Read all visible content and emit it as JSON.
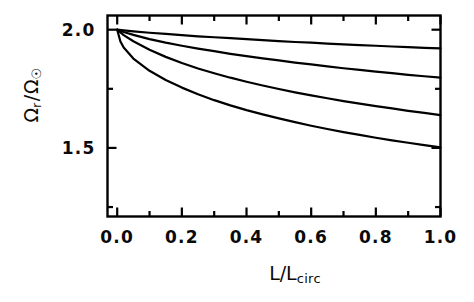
{
  "figure": {
    "background_color": "#ffffff",
    "line_color": "#000000",
    "text_color": "#0a0a0a"
  },
  "axis_titles": {
    "x_main": "L/L",
    "x_sub": "circ",
    "y_num": "Ω",
    "y_num_sub": "r",
    "y_slash": "/",
    "y_den": "Ω",
    "y_den_sub": "☉"
  },
  "chart_data": {
    "type": "line",
    "title": "",
    "xlabel": "L/L_circ",
    "ylabel": "Ω_r / Ω_☉",
    "xlim": [
      -0.03,
      1.0
    ],
    "ylim": [
      1.21,
      2.06
    ],
    "grid": false,
    "legend": null,
    "xticks": [
      0.0,
      0.2,
      0.4,
      0.6,
      0.8,
      1.0
    ],
    "xticklabels": [
      "0.0",
      "0.2",
      "0.4",
      "0.6",
      "0.8",
      "1.0"
    ],
    "xminor_ticks": [
      0.1,
      0.3,
      0.5,
      0.7,
      0.9
    ],
    "yticks": [
      1.5,
      2.0
    ],
    "yticklabels": [
      "1.5",
      "2.0"
    ],
    "yminor_ticks": [
      1.25,
      1.75
    ],
    "series": [
      {
        "name": "curve-1",
        "x": [
          0.0,
          0.02,
          0.05,
          0.1,
          0.15,
          0.2,
          0.25,
          0.3,
          0.35,
          0.4,
          0.45,
          0.5,
          0.55,
          0.6,
          0.65,
          0.7,
          0.75,
          0.8,
          0.85,
          0.9,
          0.95,
          1.0
        ],
        "y": [
          2.0,
          1.997,
          1.993,
          1.987,
          1.982,
          1.977,
          1.972,
          1.968,
          1.964,
          1.96,
          1.956,
          1.952,
          1.948,
          1.945,
          1.941,
          1.938,
          1.935,
          1.932,
          1.929,
          1.926,
          1.923,
          1.921
        ]
      },
      {
        "name": "curve-2",
        "x": [
          0.0,
          0.02,
          0.05,
          0.1,
          0.15,
          0.2,
          0.25,
          0.3,
          0.35,
          0.4,
          0.45,
          0.5,
          0.55,
          0.6,
          0.65,
          0.7,
          0.75,
          0.8,
          0.85,
          0.9,
          0.95,
          1.0
        ],
        "y": [
          2.0,
          1.99,
          1.978,
          1.96,
          1.945,
          1.932,
          1.92,
          1.909,
          1.898,
          1.888,
          1.879,
          1.87,
          1.861,
          1.853,
          1.845,
          1.837,
          1.83,
          1.823,
          1.816,
          1.809,
          1.803,
          1.797
        ]
      },
      {
        "name": "curve-3",
        "x": [
          0.0,
          0.02,
          0.05,
          0.1,
          0.15,
          0.2,
          0.25,
          0.3,
          0.35,
          0.4,
          0.45,
          0.5,
          0.55,
          0.6,
          0.65,
          0.7,
          0.75,
          0.8,
          0.85,
          0.9,
          0.95,
          1.0
        ],
        "y": [
          2.0,
          1.977,
          1.951,
          1.915,
          1.885,
          1.859,
          1.836,
          1.816,
          1.797,
          1.78,
          1.764,
          1.749,
          1.735,
          1.722,
          1.71,
          1.698,
          1.687,
          1.677,
          1.667,
          1.657,
          1.648,
          1.639
        ]
      },
      {
        "name": "curve-4",
        "x": [
          0.0,
          0.01,
          0.02,
          0.05,
          0.1,
          0.15,
          0.2,
          0.25,
          0.3,
          0.35,
          0.4,
          0.45,
          0.5,
          0.55,
          0.6,
          0.65,
          0.7,
          0.75,
          0.8,
          0.85,
          0.9,
          0.95,
          1.0
        ],
        "y": [
          2.0,
          1.95,
          1.925,
          1.878,
          1.826,
          1.787,
          1.755,
          1.727,
          1.702,
          1.68,
          1.66,
          1.642,
          1.625,
          1.609,
          1.594,
          1.58,
          1.567,
          1.555,
          1.543,
          1.532,
          1.522,
          1.512,
          1.502
        ]
      }
    ]
  },
  "tick_labels": {
    "x": [
      "0.0",
      "0.2",
      "0.4",
      "0.6",
      "0.8",
      "1.0"
    ],
    "y": [
      "2.0",
      "1.5"
    ]
  }
}
